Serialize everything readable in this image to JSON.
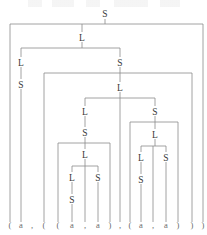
{
  "figure": {
    "kind": "parse-tree",
    "grammar_symbols": [
      "S",
      "L",
      "a",
      "(",
      ")",
      ","
    ],
    "terminal_string": "( a , ( ( a , a ) , ( a , a ) ) )"
  },
  "colors": {
    "edge": "#8c8c8c",
    "nonterminal_text": "#3a3a3a",
    "terminal_text": "#6a6a6a",
    "background": "#ffffff"
  },
  "nodes": [
    {
      "id": "n0",
      "label": "S",
      "x": 105,
      "y": 14,
      "name": "node-s-root"
    },
    {
      "id": "n1",
      "label": "L",
      "x": 82,
      "y": 38,
      "name": "node-l-level2"
    },
    {
      "id": "n2",
      "label": "L",
      "x": 21,
      "y": 63,
      "name": "node-l-left"
    },
    {
      "id": "n3",
      "label": "S",
      "x": 21,
      "y": 85,
      "name": "node-s-left"
    },
    {
      "id": "n4",
      "label": "S",
      "x": 120,
      "y": 63,
      "name": "node-s-mid"
    },
    {
      "id": "n5",
      "label": "L",
      "x": 120,
      "y": 88,
      "name": "node-l-mid"
    },
    {
      "id": "n6",
      "label": "L",
      "x": 85,
      "y": 112,
      "name": "node-l-inner-left"
    },
    {
      "id": "n7",
      "label": "S",
      "x": 85,
      "y": 133,
      "name": "node-s-inner-left"
    },
    {
      "id": "n8",
      "label": "L",
      "x": 85,
      "y": 155,
      "name": "node-l-deep-left"
    },
    {
      "id": "n9",
      "label": "L",
      "x": 72,
      "y": 178,
      "name": "node-l-leafpair-left"
    },
    {
      "id": "n10",
      "label": "S",
      "x": 72,
      "y": 200,
      "name": "node-s-leafpair-left"
    },
    {
      "id": "n11",
      "label": "S",
      "x": 98,
      "y": 178,
      "name": "node-s-leafpair-right"
    },
    {
      "id": "n12",
      "label": "S",
      "x": 155,
      "y": 112,
      "name": "node-s-inner-right"
    },
    {
      "id": "n13",
      "label": "L",
      "x": 155,
      "y": 135,
      "name": "node-l-deep-right"
    },
    {
      "id": "n14",
      "label": "L",
      "x": 141,
      "y": 158,
      "name": "node-l-leafpair2-left"
    },
    {
      "id": "n15",
      "label": "S",
      "x": 141,
      "y": 180,
      "name": "node-s-leafpair2-left"
    },
    {
      "id": "n16",
      "label": "S",
      "x": 166,
      "y": 158,
      "name": "node-s-leafpair2-right"
    }
  ],
  "terminals": [
    {
      "i": 0,
      "label": "(",
      "x": 10,
      "name": "terminal-open-paren-1"
    },
    {
      "i": 1,
      "label": "a",
      "x": 21,
      "name": "terminal-a-1"
    },
    {
      "i": 2,
      "label": ",",
      "x": 32,
      "name": "terminal-comma-1"
    },
    {
      "i": 3,
      "label": "(",
      "x": 44,
      "name": "terminal-open-paren-2"
    },
    {
      "i": 4,
      "label": "(",
      "x": 58,
      "name": "terminal-open-paren-3"
    },
    {
      "i": 5,
      "label": "a",
      "x": 72,
      "name": "terminal-a-2"
    },
    {
      "i": 6,
      "label": ",",
      "x": 85,
      "name": "terminal-comma-2"
    },
    {
      "i": 7,
      "label": "a",
      "x": 98,
      "name": "terminal-a-3"
    },
    {
      "i": 8,
      "label": ")",
      "x": 110,
      "name": "terminal-close-paren-1"
    },
    {
      "i": 9,
      "label": ",",
      "x": 120,
      "name": "terminal-comma-3"
    },
    {
      "i": 10,
      "label": "(",
      "x": 130,
      "name": "terminal-open-paren-4"
    },
    {
      "i": 11,
      "label": "a",
      "x": 141,
      "name": "terminal-a-4"
    },
    {
      "i": 12,
      "label": ",",
      "x": 153,
      "name": "terminal-comma-4"
    },
    {
      "i": 13,
      "label": "a",
      "x": 166,
      "name": "terminal-a-5"
    },
    {
      "i": 14,
      "label": ")",
      "x": 178,
      "name": "terminal-close-paren-2"
    },
    {
      "i": 15,
      "label": ")",
      "x": 192,
      "name": "terminal-close-paren-3"
    },
    {
      "i": 16,
      "label": ")",
      "x": 203,
      "name": "terminal-close-paren-4"
    }
  ],
  "terminal_baseline_y": 228,
  "edges": [
    {
      "from": "n0",
      "to_x": 105,
      "bar_y": 24,
      "children_x": [
        10,
        82,
        203
      ],
      "name": "edge-group-s-root"
    },
    {
      "from": "n1",
      "to_x": 82,
      "bar_y": 48,
      "children_x": [
        21,
        120
      ],
      "name": "edge-group-l-level2"
    },
    {
      "from": "n2",
      "to_x": 21,
      "bar_y": 0,
      "children_x": [],
      "name": "edge-l-left-to-s"
    },
    {
      "from": "n4",
      "to_x": 120,
      "bar_y": 73,
      "children_x": [
        44,
        120,
        192
      ],
      "name": "edge-group-s-mid"
    },
    {
      "from": "n5",
      "to_x": 120,
      "bar_y": 98,
      "children_x": [
        85,
        155
      ],
      "name": "edge-group-l-mid"
    },
    {
      "from": "n7",
      "to_x": 85,
      "bar_y": 143,
      "children_x": [
        58,
        85,
        110
      ],
      "name": "edge-group-s-inner-left"
    },
    {
      "from": "n8",
      "to_x": 85,
      "bar_y": 166,
      "children_x": [
        72,
        98
      ],
      "name": "edge-group-l-deep-left"
    },
    {
      "from": "n12",
      "to_x": 155,
      "bar_y": 122,
      "children_x": [
        130,
        155,
        178
      ],
      "name": "edge-group-s-inner-right"
    },
    {
      "from": "n13",
      "to_x": 155,
      "bar_y": 146,
      "children_x": [
        141,
        166
      ],
      "name": "edge-group-l-deep-right"
    }
  ]
}
